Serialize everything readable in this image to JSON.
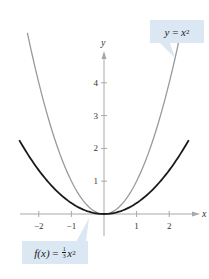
{
  "chart_data": {
    "type": "line",
    "title": "",
    "xlabel": "x",
    "ylabel": "y",
    "xlim": [
      -2.6,
      2.9
    ],
    "ylim": [
      -0.6,
      5.0
    ],
    "grid": false,
    "x_ticks": [
      -2,
      -1,
      1,
      2
    ],
    "x_tick_labels": [
      "−2",
      "−1",
      "1",
      "2"
    ],
    "y_ticks": [
      1,
      2,
      3,
      4
    ],
    "y_tick_labels": [
      "1",
      "2",
      "3",
      "4"
    ],
    "series": [
      {
        "name": "y = x²",
        "expression": "x^2",
        "color": "#9a9a9a",
        "x_range": [
          -2.35,
          2.35
        ],
        "x": [
          -2.35,
          -2,
          -1.5,
          -1,
          -0.5,
          0,
          0.5,
          1,
          1.5,
          2,
          2.35
        ],
        "values": [
          5.52,
          4,
          2.25,
          1,
          0.25,
          0,
          0.25,
          1,
          2.25,
          4,
          5.52
        ]
      },
      {
        "name": "f(x) = (1/3)x²",
        "expression": "x^2/3",
        "color": "#1a1a1a",
        "x_range": [
          -2.6,
          2.6
        ],
        "x": [
          -2.6,
          -2,
          -1.5,
          -1,
          -0.5,
          0,
          0.5,
          1,
          1.5,
          2,
          2.6
        ],
        "values": [
          2.25,
          1.33,
          0.75,
          0.33,
          0.08,
          0,
          0.08,
          0.33,
          0.75,
          1.33,
          2.25
        ]
      }
    ],
    "annotations": [
      {
        "text": "y = x²",
        "points_to": "gray curve, upper right"
      },
      {
        "text": "f(x) = ⅓x²",
        "points_to": "black curve, near origin left"
      }
    ],
    "legend": "callout boxes"
  },
  "labels": {
    "x_axis": "x",
    "y_axis": "y",
    "callout_top": {
      "lhs": "y",
      "eq": " = ",
      "var": "x",
      "exp": "2"
    },
    "callout_bottom": {
      "lhs": "f(x)",
      "eq": " = ",
      "num": "1",
      "den": "3",
      "var": "x",
      "exp": "2"
    }
  },
  "colors": {
    "axis": "#a8a8a8",
    "callout_bg": "#dbe7f3",
    "curve_gray": "#9a9a9a",
    "curve_black": "#1a1a1a"
  }
}
